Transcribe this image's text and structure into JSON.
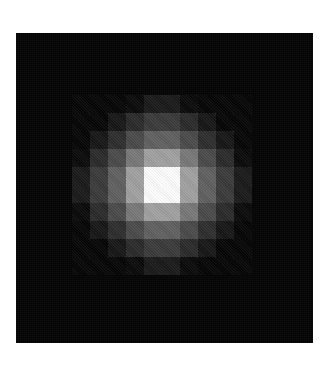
{
  "figure": {
    "title": "",
    "background_color": "#ffffff",
    "panel": {
      "name": "image-panel",
      "background_color": "#050505",
      "left": 16,
      "top": 33,
      "width": 297,
      "height": 310,
      "border_color": "#050505"
    }
  },
  "chart_data": {
    "type": "heatmap",
    "title": "",
    "subtitle": "",
    "xlabel": "",
    "ylabel": "",
    "legend": [],
    "annotations": [],
    "grid": false,
    "colormap": "grayscale",
    "colormap_min_color": "#050505",
    "colormap_max_color": "#ffffff",
    "cell_size_px": 18,
    "origin_x_px": 56,
    "origin_y_px": 62,
    "ncols": 10,
    "nrows": 10,
    "x": [
      0,
      1,
      2,
      3,
      4,
      5,
      6,
      7,
      8,
      9
    ],
    "y": [
      0,
      1,
      2,
      3,
      4,
      5,
      6,
      7,
      8,
      9
    ],
    "zlim": [
      0,
      255
    ],
    "values": [
      [
        5,
        5,
        5,
        10,
        26,
        26,
        10,
        5,
        5,
        5
      ],
      [
        5,
        5,
        22,
        42,
        58,
        58,
        42,
        22,
        5,
        5
      ],
      [
        5,
        22,
        45,
        74,
        96,
        96,
        74,
        45,
        22,
        5
      ],
      [
        10,
        42,
        74,
        120,
        160,
        160,
        120,
        74,
        42,
        10
      ],
      [
        26,
        58,
        96,
        160,
        252,
        252,
        160,
        96,
        58,
        26
      ],
      [
        26,
        58,
        96,
        160,
        252,
        252,
        160,
        96,
        58,
        26
      ],
      [
        10,
        42,
        74,
        120,
        160,
        160,
        120,
        74,
        42,
        10
      ],
      [
        5,
        22,
        45,
        74,
        96,
        96,
        74,
        45,
        22,
        5
      ],
      [
        5,
        5,
        22,
        42,
        58,
        58,
        42,
        22,
        5,
        5
      ],
      [
        5,
        5,
        5,
        10,
        26,
        26,
        10,
        5,
        5,
        5
      ]
    ]
  }
}
